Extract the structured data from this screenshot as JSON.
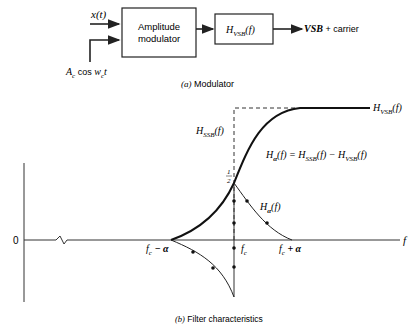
{
  "modulator": {
    "input_signal": "x(t)",
    "carrier_input": "A",
    "carrier_sub": "c",
    "carrier_mid": " cos w",
    "carrier_sub2": "c",
    "carrier_end": "t",
    "block1_line1": "Amplitude",
    "block1_line2": "modulator",
    "block2_H": "H",
    "block2_sub": "VSB",
    "block2_arg": "(f)",
    "output_label_italic": "VSB",
    "output_label_rest": " + carrier",
    "caption_tag": "(a)",
    "caption": "Modulator"
  },
  "filter": {
    "label_hvsb_H": "H",
    "label_hvsb_sub": "VSB",
    "label_hvsb_arg": "(f)",
    "label_hssb_H": "H",
    "label_hssb_sub": "SSB",
    "label_hssb_arg": "(f)",
    "equation": "Hα(f) = HSSB(f) − HVSB(f)",
    "eq_H1": "H",
    "eq_sub1": "α",
    "eq_rest1": "(f) = H",
    "eq_sub2": "SSB",
    "eq_rest2": "(f) − H",
    "eq_sub3": "VSB",
    "eq_rest3": "(f)",
    "half_num": "1",
    "half_den": "2",
    "label_halpha_H": "H",
    "label_halpha_sub": "α",
    "label_halpha_arg": "(f)",
    "zero_label": "0",
    "f_axis_label": "f",
    "fc_minus_f": "f",
    "fc_minus_sub": "c",
    "fc_minus_rest": " − α",
    "fc_f": "f",
    "fc_sub": "c",
    "fc_plus_f": "f",
    "fc_plus_sub": "c",
    "fc_plus_rest": " + α",
    "caption_tag": "(b)",
    "caption": "Filter characteristics"
  }
}
